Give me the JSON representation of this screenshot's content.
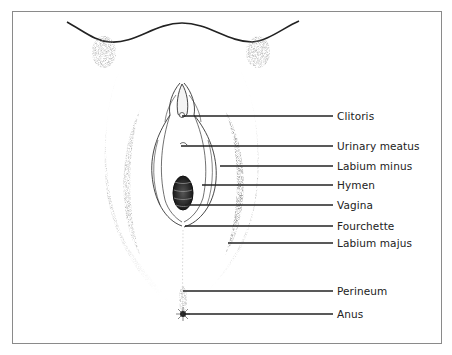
{
  "figure": {
    "labels": [
      {
        "text": "Clitoris",
        "y": 116,
        "line_start_x": 182
      },
      {
        "text": "Urinary meatus",
        "y": 146,
        "line_start_x": 181
      },
      {
        "text": "Labium minus",
        "y": 166,
        "line_start_x": 220
      },
      {
        "text": "Hymen",
        "y": 185,
        "line_start_x": 202
      },
      {
        "text": "Vagina",
        "y": 205,
        "line_start_x": 185
      },
      {
        "text": "Fourchette",
        "y": 226,
        "line_start_x": 185
      },
      {
        "text": "Labium majus",
        "y": 243,
        "line_start_x": 228
      },
      {
        "text": "Perineum",
        "y": 291,
        "line_start_x": 183
      },
      {
        "text": "Anus",
        "y": 314,
        "line_start_x": 183
      }
    ]
  }
}
